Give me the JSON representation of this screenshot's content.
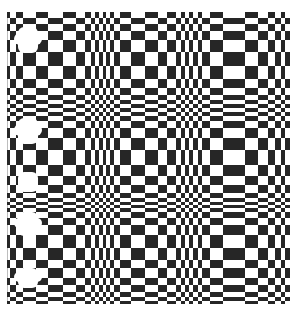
{
  "image": {
    "description": "Black and white checkerboard optical illusion with non-uniform column widths and row heights, bulging and compressing bands",
    "width": 292,
    "height": 314,
    "colors": {
      "dark": "#262626",
      "light": "#ffffff",
      "frame": "#bdbdbd"
    }
  },
  "grid": {
    "cols": [
      7,
      10,
      16,
      23,
      36,
      48,
      63,
      76,
      85,
      91,
      95,
      99,
      103,
      106,
      110,
      114,
      120,
      131,
      145,
      158,
      167,
      176,
      181,
      185,
      189,
      193,
      198,
      202,
      210,
      223,
      245,
      258,
      268,
      275,
      281,
      285,
      290
    ],
    "rows": [
      12,
      18,
      24,
      31,
      40,
      52,
      66,
      79,
      88,
      95,
      100,
      104,
      108,
      112,
      116,
      121,
      128,
      138,
      150,
      165,
      176,
      185,
      193,
      198,
      202,
      205,
      208,
      212,
      218,
      225,
      235,
      248,
      260,
      268,
      278,
      285,
      292,
      297,
      301,
      304
    ],
    "start_dark": true
  },
  "blobs": [
    {
      "x": 18,
      "y": 27,
      "w": 20,
      "h": 26
    },
    {
      "x": 14,
      "y": 33,
      "w": 28,
      "h": 12
    },
    {
      "x": 18,
      "y": 118,
      "w": 20,
      "h": 26
    },
    {
      "x": 14,
      "y": 124,
      "w": 28,
      "h": 12
    },
    {
      "x": 18,
      "y": 172,
      "w": 20,
      "h": 20
    },
    {
      "x": 18,
      "y": 212,
      "w": 20,
      "h": 24
    },
    {
      "x": 14,
      "y": 218,
      "w": 28,
      "h": 10
    },
    {
      "x": 18,
      "y": 268,
      "w": 20,
      "h": 20
    },
    {
      "x": 14,
      "y": 272,
      "w": 28,
      "h": 10
    }
  ]
}
